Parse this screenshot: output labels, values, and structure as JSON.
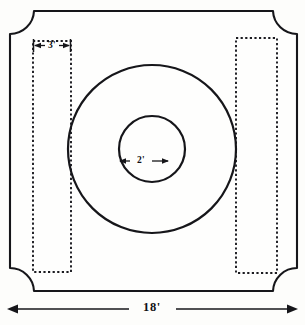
{
  "diagram": {
    "paper_color": "#fdfdfb",
    "ink_color": "#16161a",
    "slab": {
      "name": "notched-square-slab",
      "corner_style": "concave-quarter-round"
    },
    "circles": [
      {
        "name": "outer-circle",
        "label": ""
      },
      {
        "name": "inner-circle",
        "label": ""
      }
    ],
    "forms": [
      {
        "name": "left-form",
        "style": "dashed"
      },
      {
        "name": "right-form",
        "style": "dashed"
      }
    ],
    "dimensions": {
      "form_width": "3'",
      "inner_circle_diameter": "2'",
      "overall_width": "18'"
    }
  }
}
